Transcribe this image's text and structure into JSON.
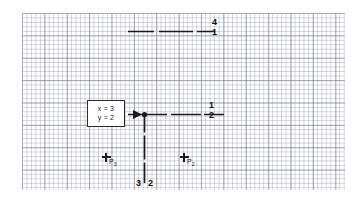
{
  "diagram": {
    "title": "",
    "background": "#ffffff",
    "ink_color": "#1b1b1b",
    "grid": {
      "minor_color": "#7880911a",
      "major_color": "#5a5f6e",
      "minor_spacing_px": 4.48,
      "major_every": 5
    },
    "value_box": {
      "line1": "x = 3",
      "line2": "y = 2"
    },
    "labels": {
      "top_right_numerator": "4",
      "top_right_denominator": "1",
      "mid_right_numerator": "1",
      "mid_right_denominator": "2",
      "bottom_left_number": "3",
      "bottom_right_number": "2"
    },
    "points": [
      {
        "id": "p3",
        "label": "P",
        "subscript": "3"
      },
      {
        "id": "p2",
        "label": "P",
        "subscript": "2"
      }
    ]
  }
}
